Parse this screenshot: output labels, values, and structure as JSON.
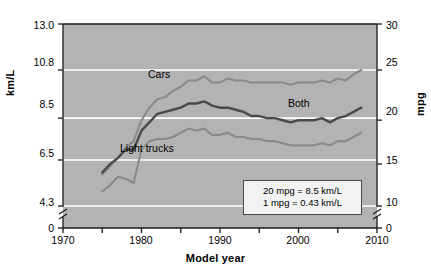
{
  "chart_data": {
    "type": "line",
    "title": "",
    "xlabel": "Model year",
    "ylabel": "km/L",
    "ylabel_right": "mpg",
    "xlim": [
      1970,
      2010
    ],
    "ylim_left": [
      0,
      13.0
    ],
    "ylim_right": [
      0,
      30
    ],
    "grid": true,
    "grid_color": "#ffffff",
    "plot_bg": "#b3b3b3",
    "legend_position": "inline-labels",
    "axis_break_left": true,
    "axis_break_right": true,
    "yticks_left": [
      "0",
      "4.3",
      "6.5",
      "8.5",
      "10.8",
      "13.0"
    ],
    "yticks_right": [
      "0",
      "10",
      "15",
      "20",
      "25",
      "30"
    ],
    "xticks_major": [
      "1970",
      "1980",
      "1990",
      "2000",
      "2010"
    ],
    "xticks_minor": [
      "1975",
      "1985",
      "1995",
      "2005"
    ],
    "annotation_lines": [
      "20 mpg = 8.5 km/L",
      "1 mpg = 0.43 km/L"
    ],
    "series": [
      {
        "name": "Cars",
        "color": "#8a8a8a",
        "label": "Cars",
        "x": [
          1975,
          1976,
          1977,
          1978,
          1979,
          1980,
          1981,
          1982,
          1983,
          1984,
          1985,
          1986,
          1987,
          1988,
          1989,
          1990,
          1991,
          1992,
          1993,
          1994,
          1995,
          1996,
          1997,
          1998,
          1999,
          2000,
          2001,
          2002,
          2003,
          2004,
          2005,
          2006,
          2007,
          2008
        ],
        "values": [
          5.8,
          6.2,
          6.6,
          7.1,
          7.4,
          8.4,
          9.0,
          9.4,
          9.5,
          9.8,
          10.0,
          10.3,
          10.3,
          10.5,
          10.2,
          10.2,
          10.4,
          10.3,
          10.3,
          10.2,
          10.2,
          10.2,
          10.2,
          10.2,
          10.1,
          10.2,
          10.2,
          10.2,
          10.3,
          10.2,
          10.4,
          10.3,
          10.6,
          10.8
        ]
      },
      {
        "name": "Both",
        "color": "#4a4a4a",
        "label": "Both",
        "x": [
          1975,
          1976,
          1977,
          1978,
          1979,
          1980,
          1981,
          1982,
          1983,
          1984,
          1985,
          1986,
          1987,
          1988,
          1989,
          1990,
          1991,
          1992,
          1993,
          1994,
          1995,
          1996,
          1997,
          1998,
          1999,
          2000,
          2001,
          2002,
          2003,
          2004,
          2005,
          2006,
          2007,
          2008
        ],
        "values": [
          5.9,
          6.3,
          6.6,
          7.0,
          7.0,
          7.9,
          8.3,
          8.7,
          8.8,
          8.9,
          9.0,
          9.2,
          9.2,
          9.3,
          9.1,
          9.0,
          9.0,
          8.9,
          8.8,
          8.6,
          8.6,
          8.5,
          8.5,
          8.4,
          8.3,
          8.4,
          8.4,
          8.4,
          8.5,
          8.3,
          8.5,
          8.6,
          8.8,
          9.0
        ]
      },
      {
        "name": "Light trucks",
        "color": "#8a8a8a",
        "label": "Light trucks",
        "x": [
          1975,
          1976,
          1977,
          1978,
          1979,
          1980,
          1981,
          1982,
          1983,
          1984,
          1985,
          1986,
          1987,
          1988,
          1989,
          1990,
          1991,
          1992,
          1993,
          1994,
          1995,
          1996,
          1997,
          1998,
          1999,
          2000,
          2001,
          2002,
          2003,
          2004,
          2005,
          2006,
          2007,
          2008
        ],
        "values": [
          5.0,
          5.3,
          5.7,
          5.6,
          5.4,
          7.0,
          7.4,
          7.5,
          7.5,
          7.6,
          7.8,
          8.0,
          7.9,
          8.0,
          7.7,
          7.7,
          7.8,
          7.6,
          7.6,
          7.5,
          7.5,
          7.4,
          7.4,
          7.3,
          7.2,
          7.2,
          7.2,
          7.2,
          7.3,
          7.2,
          7.4,
          7.4,
          7.6,
          7.8
        ]
      }
    ]
  },
  "axes": {
    "ylabel_left": "km/L",
    "ylabel_right": "mpg",
    "xlabel": "Model year"
  },
  "annotation": {
    "line1": "20 mpg = 8.5 km/L",
    "line2": "1 mpg = 0.43 km/L"
  },
  "labels": {
    "cars": "Cars",
    "both": "Both",
    "light_trucks": "Light trucks"
  },
  "ytick_left": {
    "t0": "0",
    "t1": "4.3",
    "t2": "6.5",
    "t3": "8.5",
    "t4": "10.8",
    "t5": "13.0"
  },
  "ytick_right": {
    "t0": "0",
    "t1": "10",
    "t2": "15",
    "t3": "20",
    "t4": "25",
    "t5": "30"
  },
  "xtick": {
    "t0": "1970",
    "t1": "1980",
    "t2": "1990",
    "t3": "2000",
    "t4": "2010"
  }
}
